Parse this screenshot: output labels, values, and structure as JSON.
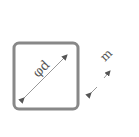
{
  "diagram": {
    "square": {
      "label": "φd",
      "description": "rounded square with diagonal dimension"
    },
    "dimension_m": {
      "label": "m"
    },
    "colors": {
      "stroke": "#777777",
      "text": "#555555",
      "background": "#ffffff"
    }
  }
}
